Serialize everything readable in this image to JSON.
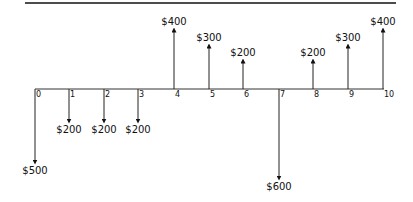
{
  "diagram": {
    "type": "cash-flow-diagram",
    "axis": {
      "periods": [
        "0",
        "1",
        "2",
        "3",
        "4",
        "5",
        "6",
        "7",
        "8",
        "9",
        "10"
      ]
    },
    "flows": [
      {
        "period": 0,
        "direction": "down",
        "label": "$500",
        "amount": 500
      },
      {
        "period": 1,
        "direction": "down",
        "label": "$200",
        "amount": 200
      },
      {
        "period": 2,
        "direction": "down",
        "label": "$200",
        "amount": 200
      },
      {
        "period": 3,
        "direction": "down",
        "label": "$200",
        "amount": 200
      },
      {
        "period": 4,
        "direction": "up",
        "label": "$400",
        "amount": 400
      },
      {
        "period": 5,
        "direction": "up",
        "label": "$300",
        "amount": 300
      },
      {
        "period": 6,
        "direction": "up",
        "label": "$200",
        "amount": 200
      },
      {
        "period": 7,
        "direction": "down",
        "label": "$600",
        "amount": 600
      },
      {
        "period": 8,
        "direction": "up",
        "label": "$200",
        "amount": 200
      },
      {
        "period": 9,
        "direction": "up",
        "label": "$300",
        "amount": 300
      },
      {
        "period": 10,
        "direction": "up",
        "label": "$400",
        "amount": 400
      }
    ]
  }
}
